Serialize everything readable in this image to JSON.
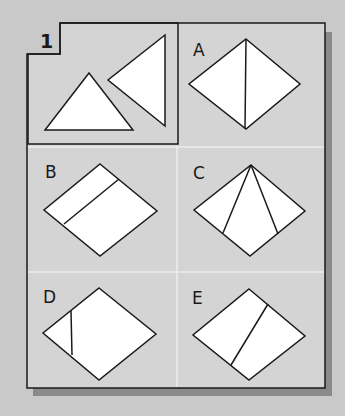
{
  "puzzle": {
    "question_label": "1",
    "question_description": "Two triangles: one upright isosceles triangle and one triangle pointing left",
    "options": [
      {
        "label": "A",
        "description": "Diamond split by a vertical line through top and bottom vertices"
      },
      {
        "label": "B",
        "description": "Diamond split by a line parallel to the upper-left edge"
      },
      {
        "label": "C",
        "description": "Diamond with two lines from the top vertex to the lower edges"
      },
      {
        "label": "D",
        "description": "Diamond with a short vertical line near the left vertex"
      },
      {
        "label": "E",
        "description": "Diamond split by a slanted line from upper-right edge to lower-left edge"
      }
    ]
  },
  "colors": {
    "background": "#c9c9c9",
    "panel": "#d4d4d4",
    "shape_fill": "#ffffff",
    "stroke": "#1a1a1a",
    "divider": "#eeeeee",
    "shadow": "#8a8a8a"
  }
}
